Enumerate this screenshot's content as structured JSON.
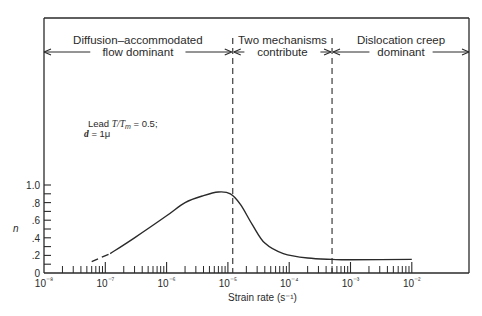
{
  "chart_data": {
    "type": "line",
    "title": "",
    "xlabel": "Strain rate (s⁻¹)",
    "ylabel": "n",
    "xscale": "log",
    "xlim": [
      1e-08,
      0.1
    ],
    "ylim": [
      0,
      1.0
    ],
    "x_tick_labels": [
      "10⁻⁸",
      "10⁻⁷",
      "10⁻⁶",
      "10⁻⁵",
      "10⁻⁴",
      "10⁻³",
      "10⁻²"
    ],
    "y_tick_labels": [
      "0",
      ".2",
      ".4",
      ".6",
      ".8",
      "1.0"
    ],
    "grid": false,
    "legend": null,
    "annotation": {
      "line1_prefix": "Lead ",
      "line1_math": "T/T",
      "line1_sub": "m",
      "line1_suffix": " = 0.5;",
      "line2_math": "d",
      "line2_suffix": " = 1μ"
    },
    "regions": [
      {
        "label_line1": "Diffusion–accommodated",
        "label_line2": "flow dominant",
        "x_from": 1e-08,
        "x_to": 1.2e-05
      },
      {
        "label_line1": "Two mechanisms",
        "label_line2": "contribute",
        "x_from": 1.2e-05,
        "x_to": 0.0005
      },
      {
        "label_line1": "Dislocation creep",
        "label_line2": "dominant",
        "x_from": 0.0005,
        "x_to": 0.1
      }
    ],
    "dividers_x": [
      1.2e-05,
      0.0005
    ],
    "series": [
      {
        "name": "n vs strain rate",
        "style": "dashed-then-solid",
        "dashed_until_x": 1.2e-07,
        "points": [
          {
            "x": 6e-08,
            "y": 0.13
          },
          {
            "x": 1.2e-07,
            "y": 0.22
          },
          {
            "x": 3e-07,
            "y": 0.4
          },
          {
            "x": 1e-06,
            "y": 0.65
          },
          {
            "x": 2e-06,
            "y": 0.8
          },
          {
            "x": 4e-06,
            "y": 0.88
          },
          {
            "x": 7e-06,
            "y": 0.92
          },
          {
            "x": 1.1e-05,
            "y": 0.9
          },
          {
            "x": 1.6e-05,
            "y": 0.78
          },
          {
            "x": 2.5e-05,
            "y": 0.55
          },
          {
            "x": 4e-05,
            "y": 0.34
          },
          {
            "x": 8e-05,
            "y": 0.22
          },
          {
            "x": 0.0002,
            "y": 0.17
          },
          {
            "x": 0.0005,
            "y": 0.155
          },
          {
            "x": 0.001,
            "y": 0.15
          },
          {
            "x": 0.01,
            "y": 0.155
          }
        ]
      }
    ]
  }
}
